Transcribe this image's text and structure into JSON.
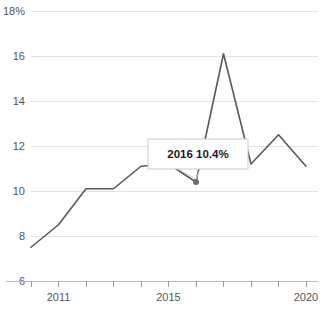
{
  "chart_data": {
    "type": "line",
    "title": "",
    "subtitle": "",
    "xlabel": "",
    "ylabel": "",
    "x": [
      2010,
      2011,
      2012,
      2013,
      2014,
      2015,
      2016,
      2017,
      2018,
      2019,
      2020
    ],
    "values": [
      7.5,
      8.5,
      10.1,
      10.1,
      11.1,
      11.2,
      10.4,
      16.1,
      11.2,
      12.5,
      11.1
    ],
    "series": [
      {
        "name": "",
        "values": [
          7.5,
          8.5,
          10.1,
          10.1,
          11.1,
          11.2,
          10.4,
          16.1,
          11.2,
          12.5,
          11.1
        ]
      }
    ],
    "ylim": [
      6,
      18
    ],
    "yticks": [
      6,
      8,
      10,
      12,
      14,
      16,
      18
    ],
    "ytick_labels": [
      "6",
      "8",
      "10",
      "12",
      "14",
      "16",
      "18%"
    ],
    "xlim": [
      2010,
      2020
    ],
    "xticks": [
      2010,
      2011,
      2012,
      2013,
      2014,
      2015,
      2016,
      2017,
      2018,
      2019,
      2020
    ],
    "xtick_labels": [
      "",
      "2011",
      "",
      "",
      "",
      "2015",
      "",
      "",
      "",
      "",
      "2020"
    ],
    "grid": "horizontal",
    "legend": "none",
    "annotations": [
      {
        "name": "tooltip",
        "x": 2016,
        "y": 10.4,
        "year_label": "2016",
        "value_label": "10.4%",
        "text": "2016 10.4%"
      }
    ],
    "colors": {
      "line": "#595959",
      "grid": "#e3e3e3",
      "axis": "#bdbdbd",
      "tick": "#9a9a9a",
      "marker": "#6b6b6b",
      "tooltip_border": "#cccccc",
      "tooltip_background": "#ffffff",
      "tooltip_text": "#1b1b1b",
      "label_text": "#555555",
      "background": "#ffffff"
    }
  }
}
